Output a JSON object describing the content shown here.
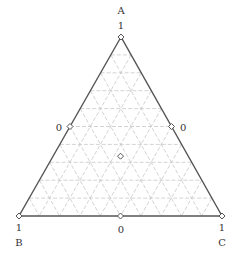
{
  "chart_data": {
    "type": "ternary",
    "title": "",
    "axes": {
      "A": {
        "label": "A",
        "vertex_tick": "1",
        "edge_tick": "0"
      },
      "B": {
        "label": "B",
        "vertex_tick": "1",
        "edge_tick": "0"
      },
      "C": {
        "label": "C",
        "vertex_tick": "1",
        "edge_tick": "0"
      }
    },
    "grid": {
      "on": true,
      "divisions": 10,
      "style": "dashed"
    },
    "points": [
      {
        "name": "A-vertex",
        "A": 1,
        "B": 0,
        "C": 0
      },
      {
        "name": "B-vertex",
        "A": 0,
        "B": 1,
        "C": 0
      },
      {
        "name": "C-vertex",
        "A": 0,
        "B": 0,
        "C": 1
      },
      {
        "name": "AB-mid",
        "A": 0.5,
        "B": 0.5,
        "C": 0
      },
      {
        "name": "AC-mid",
        "A": 0.5,
        "B": 0,
        "C": 0.5
      },
      {
        "name": "BC-mid",
        "A": 0,
        "B": 0.5,
        "C": 0.5
      },
      {
        "name": "centroid",
        "A": 0.333,
        "B": 0.333,
        "C": 0.333
      }
    ],
    "marker": "diamond"
  },
  "labels": {
    "A": "A",
    "B": "B",
    "C": "C",
    "one_a": "1",
    "one_b": "1",
    "one_c": "1",
    "zero_left": "0",
    "zero_right": "0",
    "zero_bottom": "0"
  },
  "colors": {
    "frame": "#555555",
    "grid": "#c8c8c8",
    "marker": "#555555"
  }
}
